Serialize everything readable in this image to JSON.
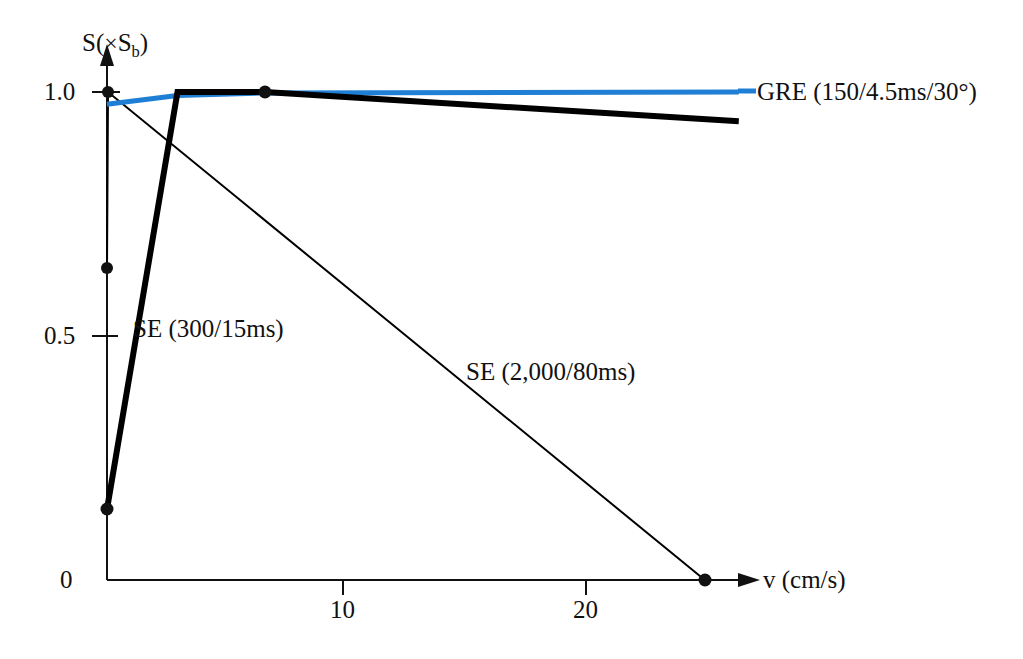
{
  "chart_data": {
    "type": "line",
    "title": "",
    "xlabel": "v (cm/s)",
    "ylabel": "S (× S_b)",
    "xlim": [
      0,
      26
    ],
    "ylim": [
      0,
      1.1
    ],
    "grid": false,
    "legend_position": "inline-right",
    "x_ticks": [
      10,
      20
    ],
    "x_tick_labels": [
      "10",
      "20"
    ],
    "y_ticks": [
      0,
      0.5,
      1.0
    ],
    "y_tick_labels": [
      "0",
      "0.5",
      "1.0"
    ],
    "series": [
      {
        "name": "GRE (150/4.5ms/30°)",
        "color": "#1f7fd4",
        "style": "solid",
        "width": "medium",
        "x": [
          0,
          2.9,
          6.5,
          26
        ],
        "y": [
          0.975,
          0.993,
          0.998,
          1.0
        ],
        "markers": []
      },
      {
        "name": "SE (300/15ms)",
        "color": "#000000",
        "style": "solid",
        "width": "thick",
        "x": [
          0,
          2.9,
          6.5,
          26
        ],
        "y": [
          0.145,
          1.0,
          1.0,
          0.94
        ],
        "markers": [
          {
            "x": 0,
            "y": 0.145
          },
          {
            "x": 6.5,
            "y": 1.0
          }
        ]
      },
      {
        "name": "SE (2,000/80ms)",
        "color": "#000000",
        "style": "solid",
        "width": "thin",
        "x": [
          0,
          0.04,
          24.6
        ],
        "y": [
          0.64,
          1.0,
          0.0
        ],
        "markers": [
          {
            "x": 0.04,
            "y": 1.0
          },
          {
            "x": 0,
            "y": 0.64
          },
          {
            "x": 24.6,
            "y": 0.0
          }
        ]
      }
    ]
  },
  "axes": {
    "y_title_main": "S",
    "y_title_paren_open": "(",
    "y_title_times": "×",
    "y_title_sym": "S",
    "y_title_sub": "b",
    "y_title_paren_close": ")",
    "y_tick_1_0": "1.0",
    "y_tick_0_5": "0.5",
    "y_tick_0": "0",
    "x_tick_10": "10",
    "x_tick_20": "20",
    "x_title": "v  (cm/s)"
  },
  "labels": {
    "gre": "GRE (150/4.5ms/30°)",
    "se_short": "SE (300/15ms)",
    "se_long": "SE (2,000/80ms)"
  },
  "colors": {
    "gre_blue": "#1f7fd4",
    "ink": "#111111",
    "background": "#ffffff"
  }
}
